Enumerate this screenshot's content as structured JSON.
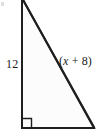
{
  "figure": {
    "type": "right-triangle-diagram",
    "canvas": {
      "width": 97,
      "height": 134,
      "background": "#ffffff"
    },
    "stroke_color": "#1f1f1f",
    "stroke_width": 2,
    "fill_color": "#fcfcfc",
    "vertices": {
      "apex": {
        "x": 22,
        "y": 0
      },
      "right_angle": {
        "x": 22,
        "y": 128
      },
      "bottom_right": {
        "x": 94,
        "y": 128
      }
    },
    "right_angle_marker": {
      "present": true,
      "at": "bottom-left-vertex",
      "size": 9
    },
    "labels": {
      "vertical_leg": "12",
      "hypotenuse_open_paren": "(",
      "hypotenuse_variable": "x",
      "hypotenuse_operator": " + ",
      "hypotenuse_constant": "8",
      "hypotenuse_close_paren": ")",
      "hypotenuse_full": "(x + 8)"
    }
  }
}
